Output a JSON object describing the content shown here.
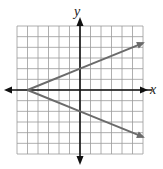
{
  "chart_data": {
    "type": "line",
    "title": "",
    "xlabel": "x",
    "ylabel": "y",
    "xlim": [
      -6,
      6
    ],
    "ylim": [
      -6,
      6
    ],
    "grid": true,
    "grid_step": 1,
    "tick_labels": false,
    "legend": null,
    "series": [
      {
        "name": "upper ray",
        "x": [
          -5,
          0,
          6
        ],
        "y": [
          0,
          2,
          4.4
        ],
        "arrow_end": true
      },
      {
        "name": "lower ray",
        "x": [
          -5,
          0,
          6
        ],
        "y": [
          0,
          -2,
          -4.4
        ],
        "arrow_end": true
      }
    ],
    "vertex": [
      -5,
      0
    ],
    "colors": {
      "line": "#6b6b6b",
      "axis": "#111111",
      "grid": "#9a9a9a"
    }
  },
  "labels": {
    "x_axis": "x",
    "y_axis": "y"
  }
}
